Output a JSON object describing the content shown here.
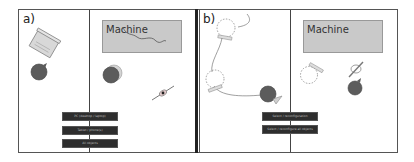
{
  "panels": [
    {
      "label": "a)",
      "machine_label": "Machine",
      "buttons": [
        "PC (desktop / laptop)",
        "Tablet / phone(s)",
        "All objects"
      ]
    },
    {
      "label": "b)",
      "machine_label": "Machine",
      "buttons": [
        "Select / reconfiguration",
        "Select / reconfigure all objects"
      ]
    }
  ],
  "colors": {
    "body_disc": "#5c5c5c",
    "machine_bg": "#c9c9c9",
    "button_bg": "#2e2e2e",
    "border": "#555555"
  }
}
